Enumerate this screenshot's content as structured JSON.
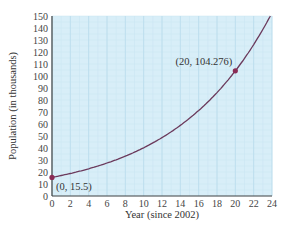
{
  "chart_data": {
    "type": "line",
    "title": "",
    "xlabel": "Year (since 2002)",
    "ylabel": "Population (in thousands)",
    "xlim": [
      0,
      24
    ],
    "ylim": [
      0,
      150
    ],
    "x_ticks": [
      0,
      2,
      4,
      6,
      8,
      10,
      12,
      14,
      16,
      18,
      20,
      22,
      24
    ],
    "y_ticks": [
      0,
      10,
      20,
      30,
      40,
      50,
      60,
      70,
      80,
      90,
      100,
      110,
      120,
      130,
      140,
      150
    ],
    "grid": true,
    "series": [
      {
        "name": "Population model",
        "model": "P(t) = 15.5 e^(0.0953 t)",
        "x": [
          0,
          2,
          4,
          6,
          8,
          10,
          12,
          14,
          16,
          18,
          20,
          22,
          23.8
        ],
        "values": [
          15.5,
          18.8,
          22.7,
          27.5,
          33.2,
          40.2,
          48.6,
          58.8,
          71.1,
          86.1,
          104.276,
          126.2,
          150.0
        ],
        "color": "#6b3a5c"
      }
    ],
    "points": [
      {
        "x": 0,
        "y": 15.5,
        "label": "(0, 15.5)"
      },
      {
        "x": 20,
        "y": 104.276,
        "label": "(20, 104.276)"
      }
    ],
    "colors": {
      "plot_background": "#d8eef8",
      "grid_major": "#b9dcec",
      "grid_minor": "#c8e5f2",
      "curve": "#6b3a5c",
      "point": "#8a2c55",
      "axis": "#444444"
    }
  }
}
